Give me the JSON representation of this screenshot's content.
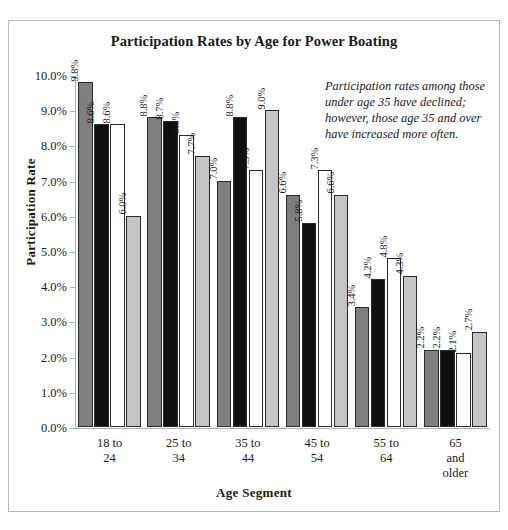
{
  "chart_data": {
    "type": "bar",
    "title": "Participation Rates by Age for Power Boating",
    "xlabel": "Age Segment",
    "ylabel": "Participation Rate",
    "ylim": [
      0,
      10
    ],
    "ytick_labels": [
      "0.0%",
      "1.0%",
      "2.0%",
      "3.0%",
      "4.0%",
      "5.0%",
      "6.0%",
      "7.0%",
      "8.0%",
      "9.0%",
      "10.0%"
    ],
    "ytick_values": [
      0,
      1,
      2,
      3,
      4,
      5,
      6,
      7,
      8,
      9,
      10
    ],
    "grid": false,
    "legend": "none",
    "categories": [
      "18 to 24",
      "25 to 34",
      "35 to 44",
      "45 to 54",
      "55 to 64",
      "65 and older"
    ],
    "category_lines": [
      [
        "18 to",
        "24"
      ],
      [
        "25 to",
        "34"
      ],
      [
        "35 to",
        "44"
      ],
      [
        "45 to",
        "54"
      ],
      [
        "55 to",
        "64"
      ],
      [
        "65",
        "and",
        "older"
      ]
    ],
    "series": [
      {
        "name": "series-1",
        "color": "#7f7f7f",
        "values": [
          9.8,
          8.8,
          7.0,
          6.6,
          3.4,
          2.2
        ],
        "labels": [
          "9.8%",
          "8.8%",
          "7.0%",
          "6.6%",
          "3.4%",
          "2.2%"
        ]
      },
      {
        "name": "series-2",
        "color": "#101010",
        "values": [
          8.6,
          8.7,
          8.8,
          5.8,
          4.2,
          2.2
        ],
        "labels": [
          "8.6%",
          "8.7%",
          "8.8%",
          "5.8%",
          "4.2%",
          "2.2%"
        ]
      },
      {
        "name": "series-3",
        "color": "#ffffff",
        "values": [
          8.6,
          8.3,
          7.3,
          7.3,
          4.8,
          2.1
        ],
        "labels": [
          "8.6%",
          "8.3%",
          "7.3%",
          "7.3%",
          "4.8%",
          "2.1%"
        ]
      },
      {
        "name": "series-4",
        "color": "#c4c4c4",
        "values": [
          6.0,
          7.7,
          9.0,
          6.6,
          4.3,
          2.7
        ],
        "labels": [
          "6.0%",
          "7.7%",
          "9.0%",
          "6.6%",
          "4.3%",
          "2.7%"
        ]
      }
    ],
    "annotation": "Participation rates among those under age 35 have declined; however, those age 35 and over have increased more often."
  }
}
